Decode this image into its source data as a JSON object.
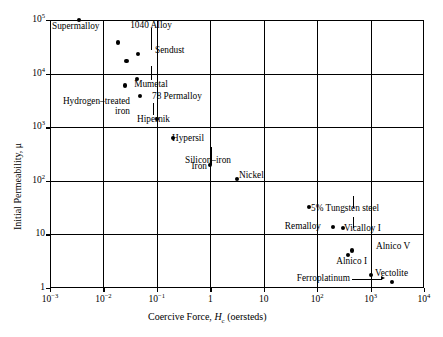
{
  "chart_data": {
    "type": "scatter",
    "title": "",
    "xlabel": "Coercive Force, Hc (oersteds)",
    "ylabel": "Initial Permeability, μ",
    "xscale": "log",
    "yscale": "log",
    "xlim": [
      0.001,
      10000
    ],
    "ylim": [
      1,
      100000
    ],
    "grid": true,
    "legend": "none",
    "x_tick_labels": [
      "10-3",
      "10-2",
      "10-1",
      "1",
      "10",
      "102",
      "103",
      "104"
    ],
    "x_tick_values": [
      0.001,
      0.01,
      0.1,
      1,
      10,
      100,
      1000,
      10000
    ],
    "y_tick_labels": [
      "1",
      "10",
      "102",
      "103",
      "104",
      "105"
    ],
    "y_tick_values": [
      1,
      10,
      100,
      1000,
      10000,
      100000
    ],
    "points": [
      {
        "label": "Supermalloy",
        "x": 0.0035,
        "y": 100000
      },
      {
        "label": "1040 Alloy",
        "x": 0.019,
        "y": 38000
      },
      {
        "label": "Sendust",
        "x": 0.045,
        "y": 23000
      },
      {
        "label": "Mumetal",
        "x": 0.027,
        "y": 17000
      },
      {
        "label": "78 Permalloy",
        "x": 0.042,
        "y": 7800
      },
      {
        "label": "Hydrogen–treated iron",
        "x": 0.025,
        "y": 6000
      },
      {
        "label": "Hipernik",
        "x": 0.048,
        "y": 3800
      },
      {
        "label": "Hypersil",
        "x": 0.1,
        "y": 1450
      },
      {
        "label": "Silicon–iron",
        "x": 0.2,
        "y": 620
      },
      {
        "label": "Iron",
        "x": 1.0,
        "y": 200
      },
      {
        "label": "Nickel",
        "x": 3.2,
        "y": 110
      },
      {
        "label": "5% Tungsten steel",
        "x": 70,
        "y": 33
      },
      {
        "label": "Remalloy",
        "x": 200,
        "y": 14
      },
      {
        "label": "Vicalloy I",
        "x": 300,
        "y": 13
      },
      {
        "label": "Alnico V",
        "x": 450,
        "y": 5.0
      },
      {
        "label": "Alnico I",
        "x": 380,
        "y": 4.2
      },
      {
        "label": "Vectolite",
        "x": 1000,
        "y": 1.75
      },
      {
        "label": "Ferroplatinum",
        "x": 2500,
        "y": 1.3
      }
    ]
  },
  "axes": {
    "x_title_prefix": "Coercive Force, ",
    "x_title_symbol": "H",
    "x_title_sub": "c",
    "x_title_suffix": " (oersteds)",
    "y_title": "Initial Permeability, μ"
  },
  "tick_text": {
    "x": [
      {
        "base": "10",
        "exp": "−3"
      },
      {
        "base": "10",
        "exp": "−2"
      },
      {
        "base": "10",
        "exp": "−1"
      },
      {
        "base": "1",
        "exp": ""
      },
      {
        "base": "10",
        "exp": ""
      },
      {
        "base": "10",
        "exp": "2"
      },
      {
        "base": "10",
        "exp": "3"
      },
      {
        "base": "10",
        "exp": "4"
      }
    ],
    "y": [
      {
        "base": "1",
        "exp": ""
      },
      {
        "base": "10",
        "exp": ""
      },
      {
        "base": "10",
        "exp": "2"
      },
      {
        "base": "10",
        "exp": "3"
      },
      {
        "base": "10",
        "exp": "4"
      },
      {
        "base": "10",
        "exp": "5"
      }
    ]
  },
  "point_labels": {
    "supermalloy": "Supermalloy",
    "alloy_1040": "1040 Alloy",
    "sendust": "Sendust",
    "mumetal": "Mumetal",
    "permalloy_78": "78 Permalloy",
    "hydrogen_treated_iron_line1": "Hydrogen–treated",
    "hydrogen_treated_iron_line2": "iron",
    "hipernik": "Hipernik",
    "hypersil": "Hypersil",
    "silicon_iron": "Silicon–iron",
    "iron": "Iron",
    "nickel": "Nickel",
    "tungsten_steel": "5% Tungsten steel",
    "remalloy": "Remalloy",
    "vicalloy_i": "Vicalloy I",
    "alnico_v": "Alnico V",
    "alnico_i": "Alnico I",
    "vectolite": "Vectolite",
    "ferroplatinum": "Ferroplatinum"
  },
  "colors": {
    "axis": "#000000",
    "marker": "#000000",
    "background": "#ffffff"
  }
}
